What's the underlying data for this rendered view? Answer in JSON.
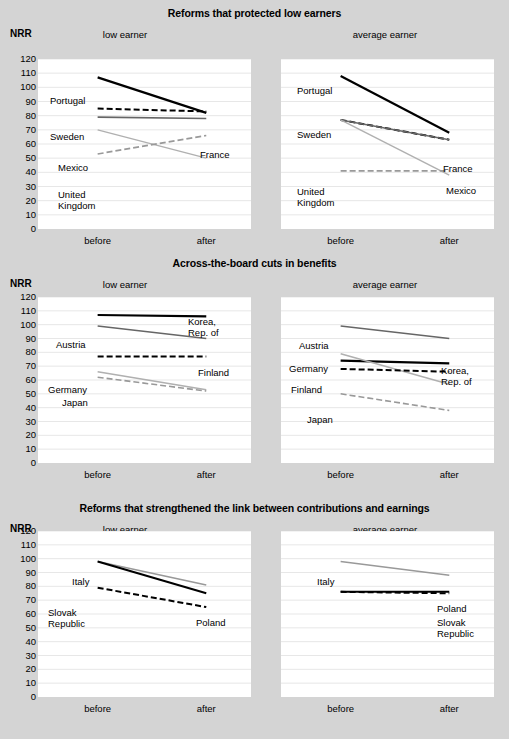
{
  "axis": {
    "y_title": "NRR",
    "y_ticks": [
      120,
      110,
      100,
      90,
      80,
      70,
      60,
      50,
      40,
      30,
      20,
      10,
      0
    ],
    "x_ticks": [
      "before",
      "after"
    ],
    "subtitle_low": "low earner",
    "subtitle_avg": "average earner"
  },
  "colors": {
    "background": "#d4d4d4",
    "plot_background": "#ffffff",
    "black": "#000000",
    "dark_gray": "#555555",
    "mid_gray": "#888888",
    "light_gray": "#b0b0b0",
    "gridline": "#dddddd"
  },
  "chart_data": [
    {
      "type": "line",
      "title": "Reforms that protected low earners",
      "subtitle": "low earner",
      "panel": 0,
      "side": "left",
      "xlabel": "",
      "ylabel": "NRR",
      "x": [
        "before",
        "after"
      ],
      "ylim": [
        0,
        120
      ],
      "grid": true,
      "legend": "inline-labels",
      "series": [
        {
          "name": "Portugal",
          "values": [
            107,
            82
          ],
          "style": "solid",
          "color": "#000000",
          "width": 2.2,
          "label_pos": "left"
        },
        {
          "name": "Sweden",
          "values": [
            85,
            83
          ],
          "style": "dashed",
          "color": "#000000",
          "width": 2.0,
          "label_pos": "left"
        },
        {
          "name": "France",
          "values": [
            79,
            78
          ],
          "style": "solid",
          "color": "#666666",
          "width": 1.6,
          "label_pos": "right"
        },
        {
          "name": "Mexico",
          "values": [
            70,
            50
          ],
          "style": "solid",
          "color": "#b0b0b0",
          "width": 1.4,
          "label_pos": "left"
        },
        {
          "name": "United Kingdom",
          "values": [
            53,
            66
          ],
          "style": "dashed",
          "color": "#999999",
          "width": 1.6,
          "label_pos": "left"
        }
      ]
    },
    {
      "type": "line",
      "title": "Reforms that protected low earners",
      "subtitle": "average earner",
      "panel": 0,
      "side": "right",
      "x": [
        "before",
        "after"
      ],
      "ylim": [
        0,
        120
      ],
      "grid": true,
      "series": [
        {
          "name": "Portugal",
          "values": [
            108,
            68
          ],
          "style": "solid",
          "color": "#000000",
          "width": 2.2,
          "label_pos": "left"
        },
        {
          "name": "Sweden",
          "values": [
            77,
            63
          ],
          "style": "dashed",
          "color": "#000000",
          "width": 2.0,
          "label_pos": "left"
        },
        {
          "name": "France",
          "values": [
            77,
            63
          ],
          "style": "solid",
          "color": "#666666",
          "width": 1.6,
          "label_pos": "right"
        },
        {
          "name": "Mexico",
          "values": [
            77,
            38
          ],
          "style": "solid",
          "color": "#b0b0b0",
          "width": 1.4,
          "label_pos": "right"
        },
        {
          "name": "United Kingdom",
          "values": [
            41,
            41
          ],
          "style": "dashed",
          "color": "#999999",
          "width": 1.6,
          "label_pos": "left"
        }
      ]
    },
    {
      "type": "line",
      "title": "Across-the-board cuts in benefits",
      "subtitle": "low earner",
      "panel": 1,
      "side": "left",
      "x": [
        "before",
        "after"
      ],
      "ylim": [
        0,
        120
      ],
      "grid": true,
      "series": [
        {
          "name": "Korea, Rep. of",
          "values": [
            107,
            106
          ],
          "style": "solid",
          "color": "#000000",
          "width": 2.2,
          "label_pos": "right"
        },
        {
          "name": "Austria",
          "values": [
            99,
            90
          ],
          "style": "solid",
          "color": "#666666",
          "width": 1.6,
          "label_pos": "left"
        },
        {
          "name": "Finland",
          "values": [
            77,
            77
          ],
          "style": "dashed",
          "color": "#000000",
          "width": 2.0,
          "label_pos": "right"
        },
        {
          "name": "Germany",
          "values": [
            66,
            53
          ],
          "style": "solid",
          "color": "#b0b0b0",
          "width": 1.6,
          "label_pos": "left"
        },
        {
          "name": "Japan",
          "values": [
            62,
            52
          ],
          "style": "dashed",
          "color": "#999999",
          "width": 1.6,
          "label_pos": "left"
        }
      ]
    },
    {
      "type": "line",
      "title": "Across-the-board cuts in benefits",
      "subtitle": "average earner",
      "panel": 1,
      "side": "right",
      "x": [
        "before",
        "after"
      ],
      "ylim": [
        0,
        120
      ],
      "grid": true,
      "series": [
        {
          "name": "Austria",
          "values": [
            99,
            90
          ],
          "style": "solid",
          "color": "#666666",
          "width": 1.6,
          "label_pos": "left"
        },
        {
          "name": "Korea, Rep. of",
          "values": [
            74,
            72
          ],
          "style": "solid",
          "color": "#000000",
          "width": 2.2,
          "label_pos": "right"
        },
        {
          "name": "Germany",
          "values": [
            79,
            57
          ],
          "style": "solid",
          "color": "#b0b0b0",
          "width": 1.6,
          "label_pos": "left"
        },
        {
          "name": "Finland",
          "values": [
            68,
            66
          ],
          "style": "dashed",
          "color": "#000000",
          "width": 2.0,
          "label_pos": "left"
        },
        {
          "name": "Japan",
          "values": [
            50,
            38
          ],
          "style": "dashed",
          "color": "#999999",
          "width": 1.6,
          "label_pos": "left"
        }
      ]
    },
    {
      "type": "line",
      "title": "Reforms that strengthened the link between contributions and earnings",
      "subtitle": "low earner",
      "panel": 2,
      "side": "left",
      "x": [
        "before",
        "after"
      ],
      "ylim": [
        0,
        120
      ],
      "grid": true,
      "series": [
        {
          "name": "Italy",
          "values": [
            98,
            81
          ],
          "style": "solid",
          "color": "#999999",
          "width": 1.6,
          "label_pos": "left"
        },
        {
          "name": "Poland",
          "values": [
            98,
            75
          ],
          "style": "solid",
          "color": "#000000",
          "width": 2.0,
          "label_pos": "right"
        },
        {
          "name": "Slovak Republic",
          "values": [
            79,
            65
          ],
          "style": "dashed",
          "color": "#000000",
          "width": 2.0,
          "label_pos": "left"
        }
      ]
    },
    {
      "type": "line",
      "title": "Reforms that strengthened the link between contributions and earnings",
      "subtitle": "average earner",
      "panel": 2,
      "side": "right",
      "x": [
        "before",
        "after"
      ],
      "ylim": [
        0,
        120
      ],
      "grid": true,
      "series": [
        {
          "name": "Italy",
          "values": [
            98,
            88
          ],
          "style": "solid",
          "color": "#999999",
          "width": 1.6,
          "label_pos": "left"
        },
        {
          "name": "Poland",
          "values": [
            76,
            76
          ],
          "style": "solid",
          "color": "#000000",
          "width": 2.0,
          "label_pos": "right"
        },
        {
          "name": "Slovak Republic",
          "values": [
            76,
            75
          ],
          "style": "dashed",
          "color": "#000000",
          "width": 2.0,
          "label_pos": "right"
        }
      ]
    }
  ],
  "panels": [
    {
      "title": "Reforms that protected low earners"
    },
    {
      "title": "Across-the-board cuts in benefits"
    },
    {
      "title": "Reforms that strengthened the link between contributions and earnings"
    }
  ],
  "label_positions": {
    "0": {
      "left": [
        {
          "name": "Portugal",
          "x": 10,
          "y": 101,
          "align": "left"
        },
        {
          "name": "Sweden",
          "x": 10,
          "y": 140,
          "align": "left"
        },
        {
          "name": "Mexico",
          "x": 18,
          "y": 172,
          "align": "left"
        },
        {
          "name": "United Kingdom",
          "x": 18,
          "y": 198,
          "align": "left"
        },
        {
          "name": "France",
          "x": 164,
          "y": 152,
          "align": "left"
        }
      ],
      "right": [
        {
          "name": "Portugal",
          "x": 14,
          "y": 97,
          "align": "left"
        },
        {
          "name": "Sweden",
          "x": 14,
          "y": 140,
          "align": "left"
        },
        {
          "name": "United Kingdom",
          "x": 14,
          "y": 196,
          "align": "left"
        },
        {
          "name": "France",
          "x": 164,
          "y": 166,
          "align": "left"
        },
        {
          "name": "Mexico",
          "x": 166,
          "y": 188,
          "align": "left"
        }
      ]
    }
  }
}
